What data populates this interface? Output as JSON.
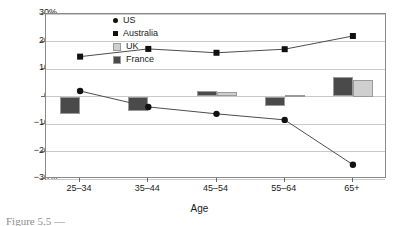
{
  "chart_data": {
    "type": "line",
    "title": "",
    "xlabel": "Age",
    "ylabel": "",
    "categories": [
      "25–34",
      "35–44",
      "45–54",
      "55–64",
      "65+"
    ],
    "ylim": [
      -30,
      30
    ],
    "ytick_labels": [
      "30%",
      "20%",
      "10%",
      "0%",
      "−10%",
      "−20%",
      "−30%"
    ],
    "ytick_values": [
      30,
      20,
      10,
      0,
      -10,
      -20,
      -30
    ],
    "grid": true,
    "legend_position": "top-center-inside",
    "series": [
      {
        "name": "US",
        "kind": "line",
        "marker": "circle",
        "color": "#111111",
        "values": [
          2.0,
          -3.8,
          -6.3,
          -8.5,
          -24.8
        ]
      },
      {
        "name": "Australia",
        "kind": "line",
        "marker": "square",
        "color": "#111111",
        "values": [
          14.5,
          17.3,
          15.9,
          17.2,
          22.0
        ]
      },
      {
        "name": "UK",
        "kind": "bar",
        "color": "#cfcfcf",
        "values": [
          0.0,
          0.0,
          1.6,
          0.6,
          6.0
        ]
      },
      {
        "name": "France",
        "kind": "bar",
        "color": "#4a4a4a",
        "values": [
          -6.5,
          -5.1,
          1.9,
          -3.5,
          7.1
        ]
      }
    ]
  },
  "legend": {
    "items": [
      {
        "label": "US",
        "swatch": "circle-marker-icon"
      },
      {
        "label": "Australia",
        "swatch": "square-marker-icon"
      },
      {
        "label": "UK",
        "swatch": "uk-bar-swatch-icon"
      },
      {
        "label": "France",
        "swatch": "france-bar-swatch-icon"
      }
    ]
  },
  "caption": {
    "text": "Figure 5.5  —"
  }
}
